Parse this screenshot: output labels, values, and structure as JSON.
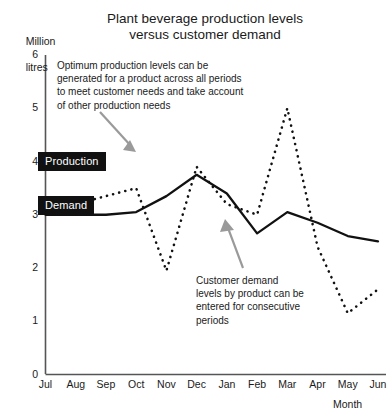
{
  "chart_data": {
    "type": "line",
    "title": "Plant beverage production levels versus customer demand",
    "title_line1": "Plant beverage production levels",
    "title_line2": "versus customer demand",
    "xlabel": "Month",
    "ylabel": "Million litres",
    "ylabel_line1": "Million",
    "ylabel_line2": "litres",
    "categories": [
      "Jul",
      "Aug",
      "Sep",
      "Oct",
      "Nov",
      "Dec",
      "Jan",
      "Feb",
      "Mar",
      "Apr",
      "May",
      "Jun"
    ],
    "ylim": [
      0,
      6
    ],
    "yticks": [
      0,
      1,
      2,
      3,
      4,
      5,
      6
    ],
    "grid": false,
    "legend_position": "inline-labels",
    "series": [
      {
        "name": "Production",
        "style": "solid",
        "color": "#111111",
        "values": [
          3.0,
          3.0,
          3.0,
          3.05,
          3.35,
          3.75,
          3.4,
          2.65,
          3.05,
          2.85,
          2.6,
          2.5
        ]
      },
      {
        "name": "Demand",
        "style": "dotted",
        "color": "#111111",
        "values": [
          3.1,
          3.2,
          3.35,
          3.5,
          1.95,
          3.9,
          3.2,
          3.0,
          5.0,
          2.4,
          1.15,
          1.6
        ]
      }
    ],
    "annotations": [
      {
        "id": "production-note",
        "text": "Optimum production levels can be generated for a product across all periods to meet customer needs and take account of other production needs",
        "points_to": "Production"
      },
      {
        "id": "demand-note",
        "text": "Customer demand levels by product can be entered for consecutive periods",
        "points_to": "Demand"
      }
    ]
  },
  "colors": {
    "axis": "#555555",
    "line": "#111111",
    "label_box": "#111111",
    "label_text": "#ffffff",
    "arrow": "#9a9a9a",
    "background": "#ffffff"
  }
}
